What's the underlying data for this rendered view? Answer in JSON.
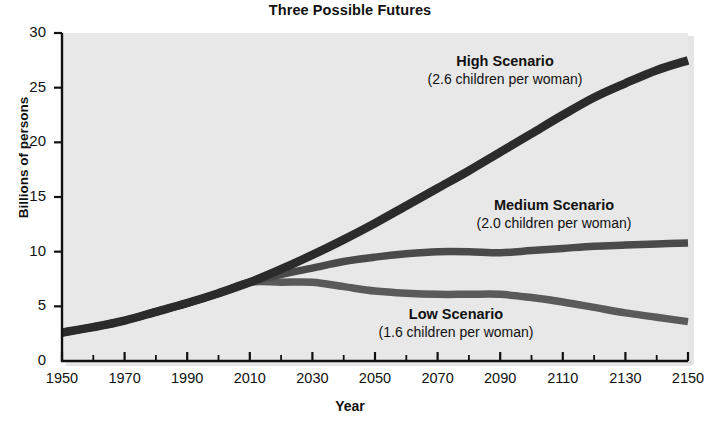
{
  "chart_data": {
    "type": "line",
    "title": "Three Possible Futures",
    "xlabel": "Year",
    "ylabel": "Billions of persons",
    "xlim": [
      1950,
      2150
    ],
    "ylim": [
      0,
      30
    ],
    "ytick_values": [
      0,
      5,
      10,
      15,
      20,
      25,
      30
    ],
    "ytick_labels": [
      "0",
      "5",
      "10",
      "15",
      "20",
      "25",
      "30"
    ],
    "xtick_values": [
      1950,
      1970,
      1990,
      2010,
      2030,
      2050,
      2070,
      2090,
      2110,
      2130,
      2150
    ],
    "xtick_labels": [
      "1950",
      "1970",
      "1990",
      "2010",
      "2030",
      "2050",
      "2070",
      "2090",
      "2110",
      "2130",
      "2150"
    ],
    "minor_xtick_step": 10,
    "grid": false,
    "legend_position": "inline-annotations",
    "plot_background": "#e8e8e8",
    "series": [
      {
        "name": "High Scenario",
        "color": "#2b2b2b",
        "x": [
          1950,
          1960,
          1970,
          1980,
          1990,
          2000,
          2010,
          2020,
          2030,
          2040,
          2050,
          2060,
          2070,
          2080,
          2090,
          2100,
          2110,
          2120,
          2130,
          2140,
          2150
        ],
        "values": [
          2.6,
          3.1,
          3.7,
          4.5,
          5.3,
          6.2,
          7.2,
          8.4,
          9.7,
          11.1,
          12.6,
          14.2,
          15.8,
          17.4,
          19.1,
          20.8,
          22.5,
          24.1,
          25.4,
          26.6,
          27.5
        ]
      },
      {
        "name": "Medium Scenario",
        "color": "#4a4a4a",
        "x": [
          1950,
          1960,
          1970,
          1980,
          1990,
          2000,
          2010,
          2020,
          2030,
          2040,
          2050,
          2060,
          2070,
          2080,
          2090,
          2100,
          2110,
          2120,
          2130,
          2140,
          2150
        ],
        "values": [
          2.6,
          3.1,
          3.7,
          4.5,
          5.3,
          6.2,
          7.2,
          7.9,
          8.5,
          9.1,
          9.5,
          9.8,
          10.0,
          10.0,
          9.9,
          10.1,
          10.3,
          10.5,
          10.6,
          10.7,
          10.8
        ]
      },
      {
        "name": "Low Scenario",
        "color": "#5a5a5a",
        "x": [
          1950,
          1960,
          1970,
          1980,
          1990,
          2000,
          2010,
          2020,
          2030,
          2040,
          2050,
          2060,
          2070,
          2080,
          2090,
          2100,
          2110,
          2120,
          2130,
          2140,
          2150
        ],
        "values": [
          2.6,
          3.1,
          3.7,
          4.5,
          5.3,
          6.2,
          7.2,
          7.2,
          7.2,
          6.8,
          6.4,
          6.2,
          6.1,
          6.1,
          6.1,
          5.8,
          5.4,
          4.9,
          4.4,
          4.0,
          3.6
        ]
      }
    ],
    "annotations": [
      {
        "id": "high",
        "title": "High Scenario",
        "subtitle": "(2.6 children per woman)",
        "x_px": 505,
        "y_px": 53
      },
      {
        "id": "medium",
        "title": "Medium Scenario",
        "subtitle": "(2.0 children per woman)",
        "x_px": 554,
        "y_px": 197
      },
      {
        "id": "low",
        "title": "Low Scenario",
        "subtitle": "(1.6 children per woman)",
        "x_px": 456,
        "y_px": 306
      }
    ]
  }
}
